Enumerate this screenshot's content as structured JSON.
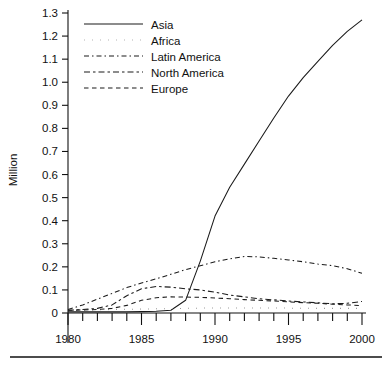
{
  "chart_data": {
    "type": "line",
    "title": "",
    "xlabel": "",
    "ylabel": "Million",
    "xlim": [
      1980,
      2000
    ],
    "ylim": [
      0,
      1.3
    ],
    "grid": false,
    "legend_position": "top-left",
    "y_ticks": [
      "0",
      "0.1",
      "0.2",
      "0.3",
      "0.4",
      "0.5",
      "0.6",
      "0.7",
      "0.8",
      "0.9",
      "1.0",
      "1.1",
      "1.2",
      "1.3"
    ],
    "y_tick_values": [
      0,
      0.1,
      0.2,
      0.3,
      0.4,
      0.5,
      0.6,
      0.7,
      0.8,
      0.9,
      1.0,
      1.1,
      1.2,
      1.3
    ],
    "x_ticks": [
      "1980",
      "1985",
      "1990",
      "1995",
      "2000"
    ],
    "x_tick_values": [
      1980,
      1985,
      1990,
      1995,
      2000
    ],
    "x_minor_step": 1,
    "x": [
      1980,
      1981,
      1982,
      1983,
      1984,
      1985,
      1986,
      1987,
      1988,
      1989,
      1990,
      1991,
      1992,
      1993,
      1994,
      1995,
      1996,
      1997,
      1998,
      1999,
      2000
    ],
    "series": [
      {
        "name": "Asia",
        "style": "solid",
        "values": [
          0.005,
          0.005,
          0.005,
          0.005,
          0.005,
          0.006,
          0.008,
          0.012,
          0.055,
          0.225,
          0.42,
          0.545,
          0.645,
          0.745,
          0.845,
          0.94,
          1.02,
          1.09,
          1.16,
          1.22,
          1.27
        ]
      },
      {
        "name": "Africa",
        "style": "dotted",
        "values": [
          0.012,
          0.013,
          0.014,
          0.015,
          0.016,
          0.017,
          0.018,
          0.019,
          0.02,
          0.021,
          0.022,
          0.022,
          0.022,
          0.022,
          0.022,
          0.021,
          0.021,
          0.02,
          0.02,
          0.02,
          0.02
        ]
      },
      {
        "name": "Latin America",
        "style": "dash-dot",
        "values": [
          0.015,
          0.035,
          0.06,
          0.085,
          0.11,
          0.13,
          0.148,
          0.168,
          0.188,
          0.205,
          0.222,
          0.235,
          0.245,
          0.243,
          0.237,
          0.23,
          0.222,
          0.212,
          0.205,
          0.192,
          0.172
        ]
      },
      {
        "name": "North America",
        "style": "long-dash-dot",
        "values": [
          0.012,
          0.015,
          0.02,
          0.035,
          0.075,
          0.105,
          0.115,
          0.112,
          0.105,
          0.1,
          0.09,
          0.078,
          0.07,
          0.062,
          0.057,
          0.052,
          0.048,
          0.044,
          0.04,
          0.042,
          0.05
        ]
      },
      {
        "name": "Europe",
        "style": "dashed",
        "values": [
          0.012,
          0.013,
          0.015,
          0.02,
          0.033,
          0.055,
          0.066,
          0.07,
          0.069,
          0.068,
          0.065,
          0.062,
          0.058,
          0.055,
          0.052,
          0.048,
          0.045,
          0.042,
          0.038,
          0.035,
          0.032
        ]
      }
    ]
  },
  "legend": {
    "items": [
      {
        "label": "Asia"
      },
      {
        "label": "Africa"
      },
      {
        "label": "Latin America"
      },
      {
        "label": "North America"
      },
      {
        "label": "Europe"
      }
    ]
  },
  "axes": {
    "y_title": "Million"
  }
}
